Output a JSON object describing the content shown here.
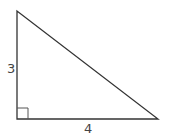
{
  "diagram": {
    "type": "right-triangle",
    "vertices": {
      "top": [
        17,
        11
      ],
      "right_angle": [
        17,
        119
      ],
      "bottom_right": [
        158,
        119
      ]
    },
    "right_angle_marker_size": 11,
    "labels": {
      "vertical_leg": "3",
      "horizontal_leg": "4"
    },
    "colors": {
      "stroke": "#333333",
      "label": "#444444",
      "background": "#ffffff"
    }
  }
}
